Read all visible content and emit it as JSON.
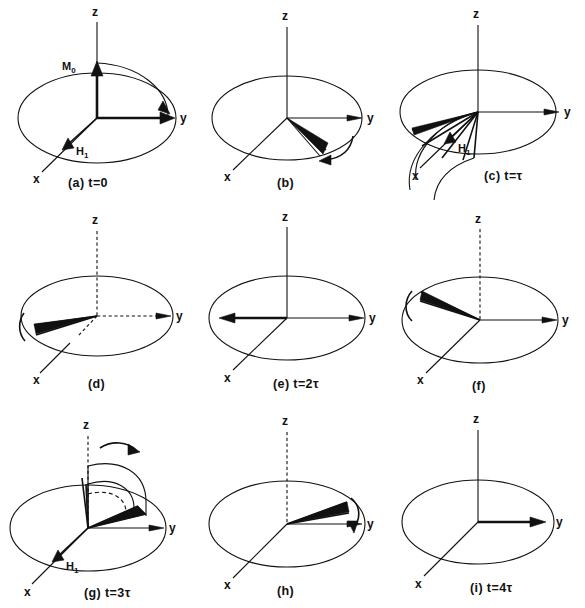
{
  "figure": {
    "type": "vector-diagram",
    "rows": 3,
    "cols": 3,
    "ink_color": "#111111",
    "background_color": "#ffffff"
  },
  "axis_labels": {
    "z": "z",
    "y": "y",
    "x": "x"
  },
  "vector_labels": {
    "m0": "M",
    "m0_sub": "0",
    "h1": "H",
    "h1_sub": "1"
  },
  "panels": [
    {
      "id": "a",
      "caption": "(a) t=0",
      "axis_z": "z",
      "axis_y": "y",
      "axis_x": "x",
      "vectors": [
        "M₀ along +z",
        "H₁ along x"
      ],
      "shows_m0": true,
      "shows_h1": true,
      "shows_flip_arc": true,
      "fan_count": 0
    },
    {
      "id": "b",
      "caption": "(b)",
      "axis_z": "z",
      "axis_y": "y",
      "axis_x": "x",
      "vectors": [
        "dephasing fan in xy-plane"
      ],
      "shows_m0": false,
      "shows_h1": false,
      "shows_flip_arc": false,
      "fan_count": 3
    },
    {
      "id": "c",
      "caption": "(c) t=τ",
      "axis_z": "z",
      "axis_y": "y",
      "axis_x": "x",
      "vectors": [
        "fanned spins",
        "H₁ along x",
        "180° pulse arcs"
      ],
      "shows_m0": false,
      "shows_h1": true,
      "shows_flip_arc": true,
      "fan_count": 5
    },
    {
      "id": "d",
      "caption": "(d)",
      "axis_z": "z",
      "axis_y": "y",
      "axis_x": "x",
      "vectors": [
        "refocusing fan toward -y"
      ],
      "shows_m0": false,
      "shows_h1": false,
      "shows_flip_arc": false,
      "fan_count": 3
    },
    {
      "id": "e",
      "caption": "(e) t=2τ",
      "axis_z": "z",
      "axis_y": "y",
      "axis_x": "x",
      "vectors": [
        "echo along -y"
      ],
      "shows_m0": false,
      "shows_h1": false,
      "shows_flip_arc": false,
      "fan_count": 1
    },
    {
      "id": "f",
      "caption": "(f)",
      "axis_z": "z",
      "axis_y": "y",
      "axis_x": "x",
      "vectors": [
        "dephasing fan after echo"
      ],
      "shows_m0": false,
      "shows_h1": false,
      "shows_flip_arc": false,
      "fan_count": 3
    },
    {
      "id": "g",
      "caption": "(g) t=3τ",
      "axis_z": "z",
      "axis_y": "y",
      "axis_x": "x",
      "vectors": [
        "second 180° pulse",
        "H₁ along x",
        "flip arcs over top"
      ],
      "shows_m0": false,
      "shows_h1": true,
      "shows_flip_arc": true,
      "fan_count": 4
    },
    {
      "id": "h",
      "caption": "(h)",
      "axis_z": "z",
      "axis_y": "y",
      "axis_x": "x",
      "vectors": [
        "refocusing fan toward +y"
      ],
      "shows_m0": false,
      "shows_h1": false,
      "shows_flip_arc": false,
      "fan_count": 3
    },
    {
      "id": "i",
      "caption": "(i) t=4τ",
      "axis_z": "z",
      "axis_y": "y",
      "axis_x": "x",
      "vectors": [
        "echo along +y"
      ],
      "shows_m0": false,
      "shows_h1": false,
      "shows_flip_arc": false,
      "fan_count": 1
    }
  ]
}
